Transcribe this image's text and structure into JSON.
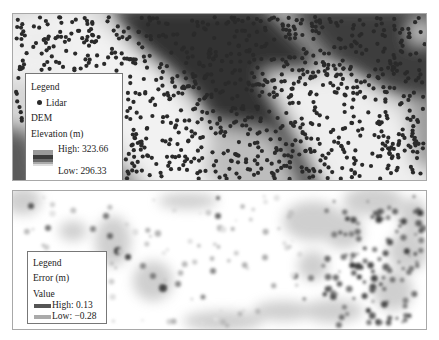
{
  "top_map": {
    "title": "DEM with Lidar points",
    "legend": {
      "title": "Legend",
      "point_label": "Lidar",
      "layer_label": "DEM",
      "field_label": "Elevation (m)",
      "high_label": "High: 323.66",
      "low_label": "Low: 296.33",
      "high_value": 323.66,
      "low_value": 296.33,
      "unit": "m"
    },
    "colors": {
      "high": "#3a3a3a",
      "low": "#f4f4f4",
      "point": "#2a2a2a"
    },
    "point_count_approx": 1100
  },
  "bottom_map": {
    "title": "Interpolation error",
    "legend": {
      "title": "Legend",
      "layer_label": "Error (m)",
      "field_label": "Value",
      "high_label": "High: 0.13",
      "low_label": "Low: −0.28",
      "high_value": 0.13,
      "low_value": -0.28,
      "unit": "m"
    },
    "colors": {
      "high": "#3c3c3c",
      "low": "#bdbdbd",
      "background": "#ffffff"
    }
  }
}
